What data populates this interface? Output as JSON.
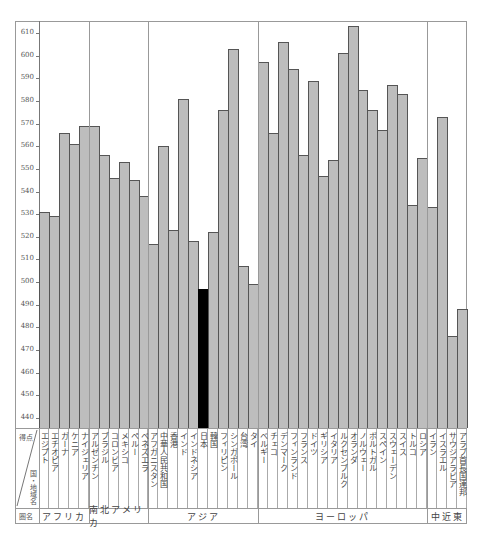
{
  "chart_data": {
    "type": "bar",
    "title": "",
    "xlabel": "国・地域名",
    "ylabel": "得点",
    "ylim": [
      435,
      615
    ],
    "yticks": [
      440,
      450,
      460,
      470,
      480,
      490,
      500,
      510,
      520,
      530,
      540,
      550,
      560,
      570,
      580,
      590,
      600,
      610
    ],
    "grid": false,
    "highlight": "日本",
    "highlight_color": "#000000",
    "bar_color": "#bdbdbd",
    "categories": [
      "エジプト",
      "エチオピア",
      "ガーナ",
      "ケニア",
      "ナイジェリア",
      "アルゼンチン",
      "ブラジル",
      "コロンビア",
      "メキシコ",
      "ペルー",
      "ベネズエラ",
      "アフガニスタン",
      "中華人民共和国",
      "香港",
      "インド",
      "インドネシア",
      "日本",
      "韓国",
      "フィリピン",
      "シンガポール",
      "台湾",
      "タイ",
      "ベルギー",
      "チェコ",
      "デンマーク",
      "フィンランド",
      "フランス",
      "ドイツ",
      "ギリシア",
      "イタリア",
      "ルクセンブルク",
      "オランダ",
      "ノルウェー",
      "ポルトガル",
      "スペイン",
      "スウェーデン",
      "スイス",
      "トルコ",
      "ロシア",
      "イラン",
      "イスラエル",
      "サウジアラビア",
      "アラブ首長国連邦"
    ],
    "values": [
      531,
      529,
      566,
      561,
      569,
      569,
      556,
      546,
      553,
      545,
      538,
      517,
      560,
      523,
      581,
      518,
      497,
      522,
      576,
      603,
      507,
      499,
      597,
      566,
      606,
      594,
      556,
      589,
      547,
      554,
      601,
      613,
      585,
      576,
      567,
      587,
      583,
      534,
      555,
      533,
      573,
      476,
      488
    ],
    "regions": [
      {
        "name": "アフリカ",
        "count": 5
      },
      {
        "name": "南北アメリカ",
        "count": 6
      },
      {
        "name": "アジア",
        "count": 11
      },
      {
        "name": "ヨーロッパ",
        "count": 17
      },
      {
        "name": "中近東",
        "count": 4
      }
    ]
  },
  "table": {
    "score_header": "得点",
    "country_header": "国・地域名",
    "region_header": "圏名"
  }
}
